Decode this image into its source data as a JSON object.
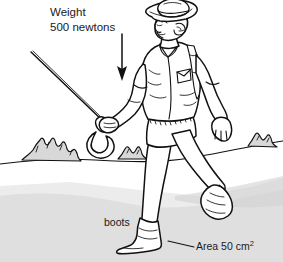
{
  "figure": {
    "background_color": "#ffffff",
    "ink_color": "#111111",
    "shade_color": "#d8d8d8"
  },
  "annotations": {
    "weight": {
      "line1": "Weight",
      "line2": "500 newtons",
      "arrow_icon": "down-arrow-icon",
      "direction": "down"
    },
    "boots": {
      "label": "boots"
    },
    "area": {
      "label": "Area 50 cm",
      "exponent": "2",
      "leader_icon": "leader-line-icon"
    }
  },
  "scene": {
    "figure_person": "walking-man",
    "headwear": "wide-brim-hat",
    "tool": "scythe",
    "footwear": "boots",
    "horizon": "horizon-line",
    "bushes": [
      "bush-left",
      "bush-center",
      "bush-right"
    ],
    "ground_shading": "foreground-shadow"
  }
}
